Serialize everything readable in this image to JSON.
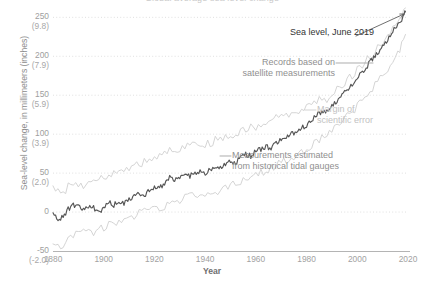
{
  "chart_data": {
    "type": "line",
    "title": "Global average sea level change",
    "xlabel": "Year",
    "ylabel": "Sea-level change, in millimeters (inches)",
    "xlim": [
      1880,
      2020
    ],
    "ylim": [
      -50,
      262
    ],
    "grid": true,
    "legend": "none",
    "x_ticks": [
      {
        "value": 1880,
        "label": "1880"
      },
      {
        "value": 1900,
        "label": "1900"
      },
      {
        "value": 1920,
        "label": "1920"
      },
      {
        "value": 1940,
        "label": "1940"
      },
      {
        "value": 1960,
        "label": "1960"
      },
      {
        "value": 1980,
        "label": "1980"
      },
      {
        "value": 2000,
        "label": "2000"
      },
      {
        "value": 2020,
        "label": "2020"
      }
    ],
    "y_ticks": [
      {
        "value": 250,
        "label": "250",
        "sublabel": "(9.8)"
      },
      {
        "value": 200,
        "label": "200",
        "sublabel": "(7.9)"
      },
      {
        "value": 150,
        "label": "150",
        "sublabel": "(5.9)"
      },
      {
        "value": 100,
        "label": "100",
        "sublabel": "(3.9)"
      },
      {
        "value": 50,
        "label": "50",
        "sublabel": "(2.0)"
      },
      {
        "value": 0,
        "label": "0",
        "sublabel": ""
      },
      {
        "value": -50,
        "label": "-50",
        "sublabel": "(-2.0)"
      }
    ],
    "series": [
      {
        "name": "Sea level change",
        "color": "#555555",
        "x": [
          1880,
          1882,
          1884,
          1886,
          1888,
          1890,
          1892,
          1894,
          1896,
          1898,
          1900,
          1902,
          1904,
          1906,
          1908,
          1910,
          1912,
          1914,
          1916,
          1918,
          1920,
          1922,
          1924,
          1926,
          1928,
          1930,
          1932,
          1934,
          1936,
          1938,
          1940,
          1942,
          1944,
          1946,
          1948,
          1950,
          1952,
          1954,
          1956,
          1958,
          1960,
          1962,
          1964,
          1966,
          1968,
          1970,
          1972,
          1974,
          1976,
          1978,
          1980,
          1982,
          1984,
          1986,
          1988,
          1990,
          1992,
          1994,
          1996,
          1998,
          2000,
          2002,
          2004,
          2006,
          2008,
          2010,
          2012,
          2014,
          2016,
          2018,
          2019
        ],
        "values": [
          0,
          -12,
          -6,
          4,
          10,
          6,
          2,
          8,
          6,
          1,
          4,
          12,
          9,
          14,
          12,
          18,
          20,
          24,
          22,
          28,
          33,
          30,
          38,
          45,
          40,
          44,
          48,
          46,
          50,
          52,
          49,
          54,
          58,
          56,
          62,
          66,
          64,
          70,
          74,
          72,
          78,
          80,
          84,
          82,
          88,
          92,
          96,
          100,
          104,
          108,
          112,
          118,
          124,
          130,
          128,
          136,
          142,
          150,
          158,
          164,
          172,
          180,
          188,
          196,
          204,
          214,
          222,
          232,
          240,
          250,
          257
        ]
      },
      {
        "name": "Upper margin of scientific error",
        "color": "#cfcfcf",
        "x": [
          1880,
          1884,
          1888,
          1892,
          1896,
          1900,
          1904,
          1908,
          1912,
          1916,
          1920,
          1924,
          1928,
          1932,
          1936,
          1940,
          1944,
          1948,
          1952,
          1956,
          1960,
          1964,
          1968,
          1972,
          1976,
          1980,
          1984,
          1988,
          1992,
          1996,
          2000,
          2004,
          2008,
          2012,
          2016,
          2019
        ],
        "values": [
          32,
          26,
          38,
          34,
          40,
          44,
          52,
          56,
          60,
          64,
          70,
          78,
          80,
          84,
          88,
          86,
          92,
          98,
          100,
          106,
          110,
          114,
          120,
          126,
          130,
          134,
          142,
          146,
          158,
          170,
          182,
          196,
          210,
          226,
          244,
          262
        ]
      },
      {
        "name": "Lower margin of scientific error",
        "color": "#cfcfcf",
        "x": [
          1880,
          1884,
          1888,
          1892,
          1896,
          1900,
          1904,
          1908,
          1912,
          1916,
          1920,
          1924,
          1928,
          1932,
          1936,
          1940,
          1944,
          1948,
          1952,
          1956,
          1960,
          1964,
          1968,
          1972,
          1976,
          1980,
          1984,
          1988,
          1992,
          1996,
          2000,
          2004,
          2008,
          2012,
          2016,
          2019
        ],
        "values": [
          -36,
          -44,
          -28,
          -24,
          -26,
          -20,
          -14,
          -8,
          -4,
          0,
          4,
          8,
          14,
          18,
          22,
          20,
          26,
          32,
          36,
          42,
          48,
          54,
          60,
          66,
          72,
          80,
          90,
          98,
          110,
          122,
          136,
          152,
          168,
          184,
          204,
          228
        ]
      }
    ],
    "annotations": [
      {
        "id": "sea-level-2019",
        "text": "Sea level, June 2019",
        "color": "#333333"
      },
      {
        "id": "satellite",
        "text": "Records based on\nsatellite measurements",
        "color": "#8f8f8f"
      },
      {
        "id": "margin-error",
        "text": "Margin of\nscientific error",
        "color": "#c2c2c2"
      },
      {
        "id": "tidal-gauges",
        "text": "Measurements estimated\nfrom historical tidal gauges",
        "color": "#8f8f8f"
      }
    ]
  }
}
